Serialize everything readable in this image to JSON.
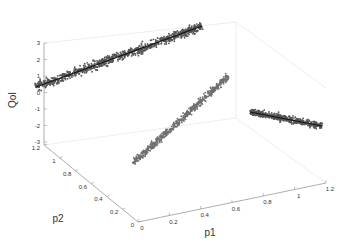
{
  "chart_data": {
    "type": "scatter",
    "title": "",
    "projection": "3d",
    "xlabel": "p1",
    "ylabel": "p2",
    "zlabel": "QoI",
    "xlim": [
      0,
      1.2
    ],
    "ylim": [
      0,
      1.2
    ],
    "zlim": [
      -3,
      3
    ],
    "x_ticks": [
      "0",
      "0.2",
      "0.4",
      "0.6",
      "0.8",
      "1",
      "1.2"
    ],
    "y_ticks": [
      "0",
      "0.2",
      "0.4",
      "0.6",
      "0.8",
      "1",
      "1.2"
    ],
    "z_ticks": [
      "-3",
      "-2",
      "-1",
      "0",
      "1",
      "2",
      "3"
    ],
    "grid": true,
    "series": [
      {
        "name": "3d-samples",
        "description": "point cloud along diagonal, QoI rising from ~-2 to ~2 as p1,p2 go 0 to 1",
        "color": "#6e6e6e"
      },
      {
        "name": "projection-p2-QoI",
        "description": "projection on back wall, QoI from ~0.5 at p2=0 to ~2.6 at p2=1",
        "color": "#555555",
        "fit_line": true
      },
      {
        "name": "projection-p1-QoI",
        "description": "projection on side wall, QoI trend from ~-1 to ~-2",
        "color": "#555555",
        "fit_line": true
      }
    ],
    "legend": null
  }
}
